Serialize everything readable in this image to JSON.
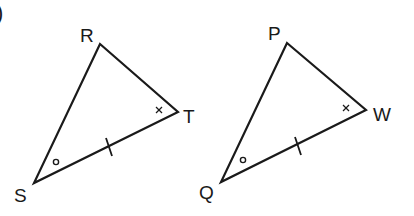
{
  "problem_marker": ")",
  "triangles": [
    {
      "name": "RST",
      "vertices": {
        "R": {
          "label": "R",
          "x": 100,
          "y": 44
        },
        "T": {
          "label": "T",
          "x": 178,
          "y": 112
        },
        "S": {
          "label": "S",
          "x": 34,
          "y": 183
        }
      },
      "marks": {
        "angle_S": "single arc (circle)",
        "angle_T": "x mark",
        "side_ST": "single tick"
      }
    },
    {
      "name": "PQW",
      "vertices": {
        "P": {
          "label": "P",
          "x": 287,
          "y": 43
        },
        "W": {
          "label": "W",
          "x": 366,
          "y": 110
        },
        "Q": {
          "label": "Q",
          "x": 221,
          "y": 182
        }
      },
      "marks": {
        "angle_Q": "single arc (circle)",
        "angle_W": "x mark",
        "side_QW": "single tick"
      }
    }
  ],
  "colors": {
    "stroke": "#1a1a1a",
    "background": "#ffffff"
  }
}
